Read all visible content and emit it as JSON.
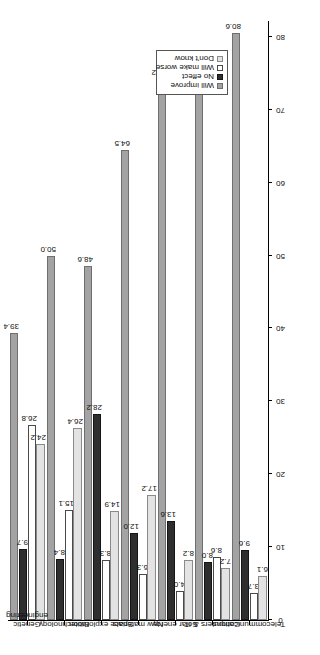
{
  "chart_data": {
    "type": "bar",
    "title": "",
    "subtitle": "",
    "orientation": "rotated-90-ccw",
    "xlabel": "",
    "ylabel": "",
    "ylim": [
      0,
      80
    ],
    "grid": false,
    "axis_ticks": [
      "0",
      "10",
      "20",
      "30",
      "40",
      "50",
      "60",
      "70",
      "80"
    ],
    "legend_position": "top-left",
    "categories": [
      "Genetic\nengineering",
      "Biotechnology",
      "Space exploration",
      "New materials",
      "Solar energy",
      "Computers & IT",
      "Telecommunications"
    ],
    "series": [
      {
        "name": "Will improve",
        "color": "#a3a3a3",
        "values": [
          39.4,
          50.0,
          48.6,
          64.5,
          74.2,
          76.1,
          80.6
        ],
        "labels": [
          "39.4",
          "50.0",
          "48.6",
          "64.5",
          "74.2",
          "76.1",
          "80.6"
        ]
      },
      {
        "name": "No effect",
        "color": "#2e2e2e",
        "values": [
          9.7,
          8.4,
          28.2,
          12.0,
          13.6,
          8.0,
          9.6
        ],
        "labels": [
          "9.7",
          "8.4",
          "28.2",
          "12.0",
          "13.6",
          "8.0",
          "9.6"
        ]
      },
      {
        "name": "Will make worse",
        "color": "#ffffff",
        "values": [
          26.8,
          15.1,
          8.3,
          6.3,
          4.0,
          8.6,
          3.7
        ],
        "labels": [
          "26.8",
          "15.1",
          "8.3",
          "6.3",
          "4.0",
          "8.6",
          "3.7"
        ]
      },
      {
        "name": "Don't know",
        "color": "#e3e3e3",
        "values": [
          24.2,
          26.4,
          14.9,
          17.2,
          8.2,
          7.2,
          6.1
        ],
        "labels": [
          "24.2",
          "26.4",
          "14.9",
          "17.2",
          "8.2",
          "7.2",
          "6.1"
        ]
      }
    ]
  },
  "legend": {
    "items": [
      {
        "label": "Will improve"
      },
      {
        "label": "No effect"
      },
      {
        "label": "Will make worse"
      },
      {
        "label": "Don't know"
      }
    ]
  }
}
